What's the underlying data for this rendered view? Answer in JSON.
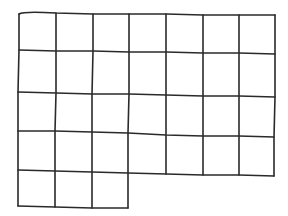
{
  "figure": {
    "stroke_color": "#2a2a2a",
    "background": "#ffffff",
    "rows": [
      {
        "row": 1,
        "cells": 7
      },
      {
        "row": 2,
        "cells": 7
      },
      {
        "row": 3,
        "cells": 7
      },
      {
        "row": 4,
        "cells": 7
      },
      {
        "row": 5,
        "cells": 3
      }
    ],
    "total_cells": 31
  }
}
